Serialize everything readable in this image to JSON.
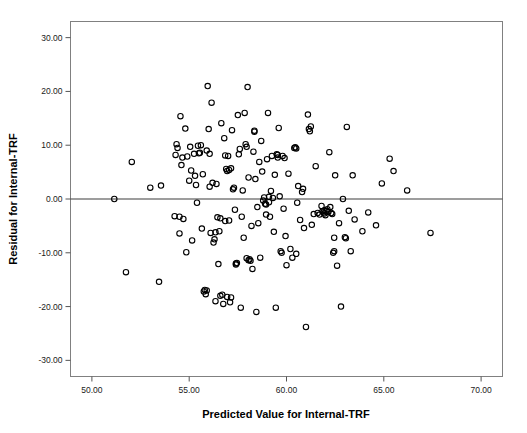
{
  "chart_data": {
    "type": "scatter",
    "title": "",
    "xlabel": "Predicted Value for Internal-TRF",
    "ylabel": "Residual for Internal-TRF",
    "xlim": [
      48.9,
      71.1
    ],
    "ylim": [
      -33.0,
      33.0
    ],
    "grid": false,
    "legend": "none",
    "marker": "open-circle",
    "marker_color": "#000000",
    "marker_fill": "none",
    "reference_line": {
      "orientation": "horizontal",
      "value": 0.0,
      "color": "#3d3d3d"
    },
    "xticks": [
      "50.00",
      "55.00",
      "60.00",
      "65.00",
      "70.00"
    ],
    "xtick_values": [
      50,
      55,
      60,
      65,
      70
    ],
    "yticks": [
      "30.00",
      "20.00",
      "10.00",
      "0.00",
      "-10.00",
      "-20.00",
      "-30.00"
    ],
    "ytick_values": [
      30,
      20,
      10,
      0,
      -10,
      -20,
      -30
    ],
    "n_points": 193,
    "points": [
      [
        51.15,
        0.0
      ],
      [
        51.75,
        -13.6
      ],
      [
        52.05,
        6.9
      ],
      [
        53.0,
        2.1
      ],
      [
        53.45,
        -15.4
      ],
      [
        53.55,
        2.5
      ],
      [
        54.25,
        -3.2
      ],
      [
        54.3,
        8.2
      ],
      [
        54.35,
        10.2
      ],
      [
        54.4,
        9.5
      ],
      [
        54.5,
        -6.4
      ],
      [
        54.55,
        15.4
      ],
      [
        54.6,
        6.3
      ],
      [
        54.65,
        7.7
      ],
      [
        54.7,
        -3.7
      ],
      [
        54.8,
        13.1
      ],
      [
        54.85,
        -9.9
      ],
      [
        55.0,
        3.4
      ],
      [
        55.05,
        9.7
      ],
      [
        55.1,
        5.3
      ],
      [
        55.15,
        -7.7
      ],
      [
        55.3,
        4.3
      ],
      [
        55.35,
        2.6
      ],
      [
        55.4,
        -0.7
      ],
      [
        55.45,
        9.9
      ],
      [
        55.5,
        8.5
      ],
      [
        55.55,
        8.6
      ],
      [
        55.6,
        10.0
      ],
      [
        55.65,
        -5.5
      ],
      [
        55.7,
        4.6
      ],
      [
        55.75,
        -17.2
      ],
      [
        55.8,
        -16.9
      ],
      [
        55.85,
        -17.7
      ],
      [
        55.9,
        9.0
      ],
      [
        55.95,
        21.0
      ],
      [
        56.0,
        13.0
      ],
      [
        56.05,
        2.3
      ],
      [
        56.1,
        -6.3
      ],
      [
        56.15,
        17.9
      ],
      [
        56.2,
        3.0
      ],
      [
        56.25,
        -8.1
      ],
      [
        56.3,
        -7.5
      ],
      [
        56.35,
        -19.0
      ],
      [
        56.4,
        2.8
      ],
      [
        56.45,
        -3.4
      ],
      [
        56.5,
        -12.1
      ],
      [
        56.55,
        -6.0
      ],
      [
        56.6,
        -3.6
      ],
      [
        56.65,
        14.1
      ],
      [
        56.7,
        -17.8
      ],
      [
        56.75,
        -19.5
      ],
      [
        56.8,
        11.3
      ],
      [
        56.85,
        8.1
      ],
      [
        56.9,
        5.6
      ],
      [
        56.95,
        5.2
      ],
      [
        57.0,
        8.0
      ],
      [
        57.05,
        -4.0
      ],
      [
        57.1,
        -19.2
      ],
      [
        57.15,
        -18.3
      ],
      [
        57.2,
        12.8
      ],
      [
        57.25,
        1.8
      ],
      [
        57.3,
        2.1
      ],
      [
        57.35,
        -2.0
      ],
      [
        57.4,
        -12.0
      ],
      [
        57.45,
        -11.9
      ],
      [
        57.5,
        15.6
      ],
      [
        57.55,
        8.3
      ],
      [
        57.6,
        9.3
      ],
      [
        57.65,
        -20.2
      ],
      [
        57.7,
        -3.3
      ],
      [
        57.75,
        1.6
      ],
      [
        57.8,
        -7.2
      ],
      [
        57.85,
        16.0
      ],
      [
        57.9,
        10.2
      ],
      [
        57.95,
        9.7
      ],
      [
        58.0,
        20.8
      ],
      [
        58.05,
        4.0
      ],
      [
        58.1,
        -11.2
      ],
      [
        58.15,
        -11.5
      ],
      [
        58.2,
        -5.0
      ],
      [
        58.25,
        -13.0
      ],
      [
        58.3,
        8.8
      ],
      [
        58.35,
        12.7
      ],
      [
        58.4,
        3.7
      ],
      [
        58.45,
        -21.0
      ],
      [
        58.5,
        -1.5
      ],
      [
        58.55,
        -4.5
      ],
      [
        58.6,
        6.9
      ],
      [
        58.65,
        -10.9
      ],
      [
        58.7,
        10.8
      ],
      [
        58.75,
        5.1
      ],
      [
        58.8,
        -0.3
      ],
      [
        58.85,
        0.3
      ],
      [
        58.9,
        -0.9
      ],
      [
        58.95,
        -2.9
      ],
      [
        59.0,
        7.4
      ],
      [
        59.05,
        16.0
      ],
      [
        59.1,
        0.4
      ],
      [
        59.15,
        -3.3
      ],
      [
        59.2,
        1.5
      ],
      [
        59.25,
        8.0
      ],
      [
        59.3,
        0.2
      ],
      [
        59.35,
        -6.1
      ],
      [
        59.4,
        4.5
      ],
      [
        59.45,
        -20.2
      ],
      [
        59.5,
        8.3
      ],
      [
        59.55,
        7.7
      ],
      [
        59.6,
        13.2
      ],
      [
        59.65,
        0.5
      ],
      [
        59.7,
        -9.7
      ],
      [
        59.75,
        -10.0
      ],
      [
        59.8,
        8.0
      ],
      [
        59.85,
        -1.8
      ],
      [
        59.9,
        7.6
      ],
      [
        59.95,
        -6.9
      ],
      [
        60.0,
        -12.3
      ],
      [
        60.1,
        4.7
      ],
      [
        60.2,
        -9.3
      ],
      [
        60.3,
        -10.9
      ],
      [
        60.4,
        9.5
      ],
      [
        60.5,
        9.4
      ],
      [
        60.55,
        -0.7
      ],
      [
        60.6,
        2.4
      ],
      [
        60.7,
        -3.9
      ],
      [
        60.8,
        1.3
      ],
      [
        60.85,
        1.9
      ],
      [
        60.9,
        -5.4
      ],
      [
        61.0,
        -23.8
      ],
      [
        61.1,
        15.7
      ],
      [
        61.15,
        13.0
      ],
      [
        61.2,
        12.6
      ],
      [
        61.25,
        13.5
      ],
      [
        61.3,
        -4.8
      ],
      [
        61.4,
        -2.8
      ],
      [
        61.5,
        6.1
      ],
      [
        61.6,
        -2.6
      ],
      [
        61.7,
        -2.9
      ],
      [
        61.8,
        -1.3
      ],
      [
        61.85,
        -2.3
      ],
      [
        61.9,
        -2.5
      ],
      [
        61.95,
        -2.7
      ],
      [
        62.0,
        -3.0
      ],
      [
        62.05,
        -2.2
      ],
      [
        62.1,
        -1.9
      ],
      [
        62.15,
        -2.4
      ],
      [
        62.2,
        8.7
      ],
      [
        62.25,
        -1.5
      ],
      [
        62.3,
        -2.6
      ],
      [
        62.35,
        -2.8
      ],
      [
        62.4,
        -10.0
      ],
      [
        62.45,
        -9.7
      ],
      [
        62.5,
        4.4
      ],
      [
        62.6,
        -12.4
      ],
      [
        62.7,
        -4.5
      ],
      [
        62.8,
        -20.0
      ],
      [
        62.9,
        0.0
      ],
      [
        63.0,
        -7.1
      ],
      [
        63.05,
        -7.3
      ],
      [
        63.1,
        13.4
      ],
      [
        63.2,
        -2.2
      ],
      [
        63.3,
        -9.7
      ],
      [
        63.4,
        4.4
      ],
      [
        63.5,
        -3.8
      ],
      [
        63.9,
        -6.0
      ],
      [
        64.2,
        -2.5
      ],
      [
        64.6,
        -4.9
      ],
      [
        64.9,
        2.9
      ],
      [
        65.3,
        7.5
      ],
      [
        65.5,
        5.2
      ],
      [
        66.2,
        1.6
      ],
      [
        67.4,
        -6.3
      ],
      [
        54.9,
        7.9
      ],
      [
        55.25,
        8.4
      ],
      [
        56.05,
        8.4
      ],
      [
        57.05,
        5.4
      ],
      [
        57.15,
        5.7
      ],
      [
        58.35,
        12.5
      ],
      [
        59.55,
        8.2
      ],
      [
        60.45,
        9.6
      ],
      [
        61.95,
        -2.1
      ],
      [
        56.35,
        -6.2
      ],
      [
        56.85,
        -4.1
      ],
      [
        57.95,
        -11.0
      ],
      [
        58.05,
        -11.4
      ],
      [
        55.9,
        -17.0
      ],
      [
        56.6,
        -18.0
      ],
      [
        56.95,
        -18.2
      ],
      [
        60.5,
        -10.2
      ],
      [
        62.45,
        -7.2
      ],
      [
        59.1,
        -0.6
      ],
      [
        58.95,
        -1.0
      ],
      [
        57.4,
        -12.2
      ],
      [
        54.5,
        -3.3
      ]
    ]
  },
  "axes": {
    "x_title": "Predicted Value for Internal-TRF",
    "y_title": "Residual for Internal-TRF",
    "frame_color": "#808080",
    "tick_color": "#555555",
    "text_color": "#1a1a1a"
  }
}
